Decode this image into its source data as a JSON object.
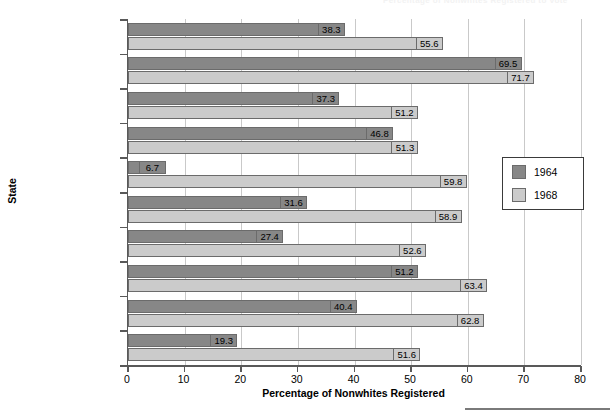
{
  "figure": {
    "top_remnant_text": "Percentage of Nonwhites Registered to Vote",
    "yaxis_title": "State",
    "xaxis_title": "Percentage of Nonwhites Registered"
  },
  "legend": {
    "position": "inside-right",
    "entries": [
      {
        "label": "1964",
        "color": "#878787"
      },
      {
        "label": "1968",
        "color": "#cbcbcb"
      }
    ]
  },
  "chart_data": {
    "type": "bar",
    "orientation": "horizontal",
    "title": "",
    "xlabel": "Percentage of Nonwhites Registered",
    "ylabel": "State",
    "xlim": [
      0,
      80
    ],
    "xticks": [
      0,
      10,
      20,
      30,
      40,
      50,
      60,
      70,
      80
    ],
    "xtick_labels": [
      "0",
      "10",
      "20",
      "30",
      "40",
      "50",
      "60",
      "70",
      "80"
    ],
    "grid": "vertical",
    "categories": [
      "Alabama",
      "Arkansas",
      "Florida",
      "Georgia",
      "Louisiana",
      "Mississippi",
      "North Carolina",
      "South Carolina",
      "Tennessee",
      "Virginia"
    ],
    "series": [
      {
        "name": "1964",
        "color": "#878787",
        "values": [
          38.3,
          69.5,
          37.3,
          46.8,
          6.7,
          31.6,
          27.4,
          51.2,
          40.4,
          19.3
        ],
        "labels": [
          "38.3",
          "69.5",
          "37.3",
          "46.8",
          "6.7",
          "31.6",
          "27.4",
          "51.2",
          "40.4",
          "19.3"
        ]
      },
      {
        "name": "1968",
        "color": "#cbcbcb",
        "values": [
          55.6,
          71.7,
          51.2,
          51.3,
          59.8,
          58.9,
          52.6,
          63.4,
          62.8,
          51.6
        ],
        "labels": [
          "55.6",
          "71.7",
          "51.2",
          "51.3",
          "59.8",
          "58.9",
          "52.6",
          "63.4",
          "62.8",
          "51.6"
        ]
      }
    ]
  }
}
